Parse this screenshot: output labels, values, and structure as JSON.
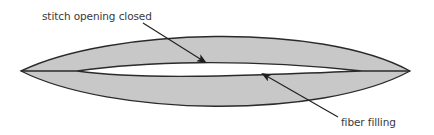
{
  "diagram": {
    "labels": {
      "stitch_opening": "stitch opening closed",
      "fiber_filling": "fiber filling"
    },
    "colors": {
      "fill": "#c8c8c8",
      "outline": "#2a2a2a",
      "opening": "#ffffff",
      "text": "#3a3a3a",
      "background": "#ffffff"
    },
    "shapes": {
      "outer_lens": {
        "left_tip": [
          21,
          71
        ],
        "right_tip": [
          410,
          71
        ],
        "top": 33,
        "bottom": 110
      },
      "inner_opening": {
        "left_tip": [
          77,
          71
        ],
        "right_tip": [
          362,
          71
        ],
        "top": 63,
        "bottom": 79
      }
    },
    "arrows": [
      {
        "label": "stitch opening closed",
        "from": [
          143,
          23
        ],
        "to": [
          205,
          63
        ]
      },
      {
        "label": "fiber filling",
        "from": [
          338,
          117
        ],
        "to": [
          262,
          74
        ]
      }
    ]
  }
}
